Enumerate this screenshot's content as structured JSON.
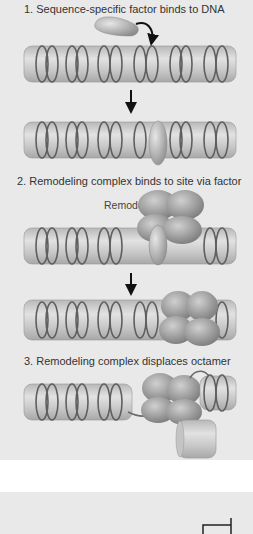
{
  "steps": [
    {
      "number": "1.",
      "label": "1. Sequence-specific factor binds to DNA"
    },
    {
      "number": "2.",
      "label": "2. Remodeling complex binds to site via factor"
    },
    {
      "number": "3.",
      "label": "3. Remodeling complex displaces octamer"
    }
  ],
  "annotations": {
    "remodeling_complex": "Remodeling complex"
  },
  "colors": {
    "background": "#e9e9e9",
    "nucleosome": "#c9c9c9",
    "dna": "#6a6a6a",
    "complex": "#8e8e8e",
    "arrow": "#111111"
  }
}
